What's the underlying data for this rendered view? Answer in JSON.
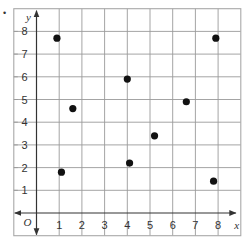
{
  "chart_data": {
    "type": "scatter",
    "title": "",
    "xlabel": "x",
    "ylabel": "y",
    "origin_label": "O",
    "xlim": [
      -1,
      9
    ],
    "ylim": [
      -1,
      9
    ],
    "grid": true,
    "legend": null,
    "x_ticks": [
      1,
      2,
      3,
      4,
      5,
      6,
      7,
      8
    ],
    "y_ticks": [
      1,
      2,
      3,
      4,
      5,
      6,
      7,
      8
    ],
    "points": [
      {
        "x": 0.9,
        "y": 7.7
      },
      {
        "x": 1.6,
        "y": 4.6
      },
      {
        "x": 4.0,
        "y": 5.9
      },
      {
        "x": 7.9,
        "y": 7.7
      },
      {
        "x": 6.6,
        "y": 4.9
      },
      {
        "x": 1.1,
        "y": 1.8
      },
      {
        "x": 4.1,
        "y": 2.2
      },
      {
        "x": 5.2,
        "y": 3.4
      },
      {
        "x": 7.8,
        "y": 1.4
      }
    ]
  },
  "colors": {
    "grid": "#9a9a9a",
    "frame": "#a8a8a8",
    "axis": "#333333",
    "point": "#111111",
    "text": "#333333"
  },
  "layout": {
    "origin_px": [
      36.5,
      213
    ],
    "unit_px": 22.7,
    "point_radius": 3.6
  },
  "bullet_marker": "•"
}
